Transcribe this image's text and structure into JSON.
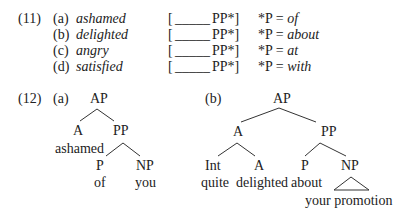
{
  "ex11": {
    "number": "(11)",
    "rows": [
      {
        "label": "(a)",
        "word": "ashamed",
        "frame_open": "[",
        "blank": "_____",
        "frame_close": "PP*]",
        "rule_prefix": "*P = ",
        "prep": "of"
      },
      {
        "label": "(b)",
        "word": "delighted",
        "frame_open": "[",
        "blank": "_____",
        "frame_close": "PP*]",
        "rule_prefix": "*P = ",
        "prep": "about"
      },
      {
        "label": "(c)",
        "word": "angry",
        "frame_open": "[",
        "blank": "_____",
        "frame_close": "PP*]",
        "rule_prefix": "*P = ",
        "prep": "at"
      },
      {
        "label": "(d)",
        "word": "satisfied",
        "frame_open": "[",
        "blank": "_____",
        "frame_close": "PP*]",
        "rule_prefix": "*P = ",
        "prep": "with"
      }
    ]
  },
  "ex12": {
    "number": "(12)",
    "a": {
      "label": "(a)",
      "root": "AP",
      "a": "A",
      "a_word": "ashamed",
      "pp": "PP",
      "p": "P",
      "p_word": "of",
      "np": "NP",
      "np_word": "you"
    },
    "b": {
      "label": "(b)",
      "root": "AP",
      "a": "A",
      "int": "Int",
      "int_word": "quite",
      "a2": "A",
      "a2_word": "delighted",
      "pp": "PP",
      "p": "P",
      "p_word": "about",
      "np": "NP",
      "np_word": "your promotion"
    }
  }
}
